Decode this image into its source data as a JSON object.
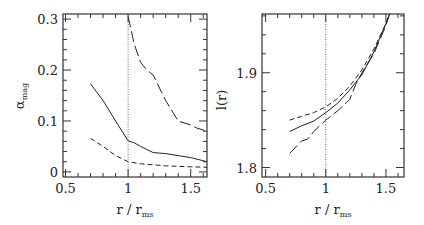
{
  "chart_data": [
    {
      "type": "line",
      "title": "",
      "xlabel": "r / r_ms",
      "xlabel_main": "r  /  r",
      "xlabel_sub": "ms",
      "ylabel": "α_mag",
      "ylabel_main": "α",
      "ylabel_sub": "mag",
      "xlim": [
        0.48,
        1.63
      ],
      "ylim": [
        -0.01,
        0.31
      ],
      "xticks": [
        "0.5",
        "1",
        "1.5"
      ],
      "yticks": [
        "0",
        "0.1",
        "0.2",
        "0.3"
      ],
      "reference_line": {
        "orientation": "vertical",
        "x": 1,
        "style": "dotted"
      },
      "grid": false,
      "legend": null,
      "series": [
        {
          "name": "solid",
          "style": "solid",
          "x": [
            0.7,
            0.8,
            0.9,
            1.0,
            1.05,
            1.1,
            1.2,
            1.3,
            1.4,
            1.5,
            1.63
          ],
          "y": [
            0.173,
            0.14,
            0.1,
            0.061,
            0.057,
            0.05,
            0.038,
            0.036,
            0.032,
            0.028,
            0.02
          ]
        },
        {
          "name": "short-dash",
          "style": "short-dashed",
          "x": [
            0.7,
            0.8,
            0.9,
            1.0,
            1.1,
            1.2,
            1.3,
            1.4,
            1.5,
            1.63
          ],
          "y": [
            0.066,
            0.05,
            0.032,
            0.02,
            0.016,
            0.014,
            0.012,
            0.011,
            0.01,
            0.009
          ]
        },
        {
          "name": "long-dash",
          "style": "long-dashed",
          "x": [
            1.0,
            1.05,
            1.1,
            1.15,
            1.2,
            1.3,
            1.4,
            1.5,
            1.55,
            1.63
          ],
          "y": [
            0.305,
            0.25,
            0.215,
            0.2,
            0.19,
            0.14,
            0.1,
            0.092,
            0.086,
            0.08
          ]
        }
      ]
    },
    {
      "type": "line",
      "title": "",
      "xlabel": "r / r_ms",
      "xlabel_main": "r  /  r",
      "xlabel_sub": "ms",
      "ylabel": "l(r)",
      "ylabel_main": "l(r)",
      "xlim": [
        0.47,
        1.65
      ],
      "ylim": [
        1.79,
        1.962
      ],
      "xticks": [
        "0.5",
        "1",
        "1.5"
      ],
      "yticks": [
        "1.8",
        "1.9"
      ],
      "reference_line": {
        "orientation": "vertical",
        "x": 1,
        "style": "dotted"
      },
      "grid": false,
      "legend": null,
      "series": [
        {
          "name": "short-dash",
          "style": "short-dashed",
          "x": [
            0.7,
            0.8,
            0.9,
            1.0,
            1.1,
            1.2,
            1.3,
            1.4,
            1.5,
            1.53
          ],
          "y": [
            1.85,
            1.854,
            1.858,
            1.864,
            1.873,
            1.886,
            1.903,
            1.925,
            1.952,
            1.962
          ]
        },
        {
          "name": "solid",
          "style": "solid",
          "x": [
            0.7,
            0.8,
            0.9,
            1.0,
            1.1,
            1.2,
            1.25,
            1.3,
            1.4,
            1.5,
            1.53
          ],
          "y": [
            1.838,
            1.844,
            1.849,
            1.858,
            1.868,
            1.882,
            1.89,
            1.898,
            1.922,
            1.952,
            1.962
          ]
        },
        {
          "name": "long-dash",
          "style": "long-dashed",
          "x": [
            0.7,
            0.8,
            0.85,
            0.9,
            1.0,
            1.1,
            1.2,
            1.25,
            1.3,
            1.4,
            1.5,
            1.53
          ],
          "y": [
            1.815,
            1.828,
            1.83,
            1.838,
            1.85,
            1.86,
            1.872,
            1.888,
            1.9,
            1.92,
            1.95,
            1.962
          ]
        }
      ]
    }
  ]
}
